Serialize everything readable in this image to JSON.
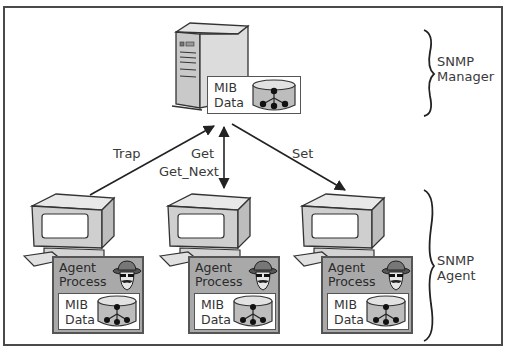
{
  "diagram": {
    "manager": {
      "mib_label_line1": "MIB",
      "mib_label_line2": "Data",
      "icon": "server-tower-icon"
    },
    "side_labels": {
      "manager_line1": "SNMP",
      "manager_line2": "Manager",
      "agent_line1": "SNMP",
      "agent_line2": "Agent"
    },
    "arrows": {
      "trap": "Trap",
      "get": "Get",
      "get_next": "Get_Next",
      "set": "Set"
    },
    "agents": [
      {
        "process_line1": "Agent",
        "process_line2": "Process",
        "mib_line1": "MIB",
        "mib_line2": "Data"
      },
      {
        "process_line1": "Agent",
        "process_line2": "Process",
        "mib_line1": "MIB",
        "mib_line2": "Data"
      },
      {
        "process_line1": "Agent",
        "process_line2": "Process",
        "mib_line1": "MIB",
        "mib_line2": "Data"
      }
    ],
    "colors": {
      "frame": "#4a4a4a",
      "agent_box": "#a9a9a9",
      "device_body": "#d6d6d6",
      "line": "#2a2a2a"
    }
  }
}
